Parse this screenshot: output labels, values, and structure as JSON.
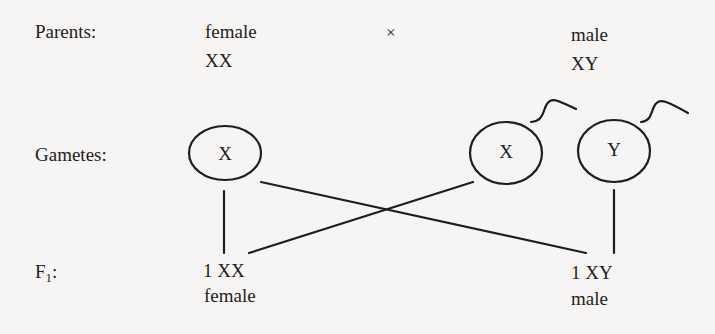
{
  "rows": {
    "parents_label": "Parents:",
    "gametes_label": "Gametes:",
    "f1_label_main": "F",
    "f1_label_sub": "1",
    "f1_label_colon": ":"
  },
  "parents": {
    "female": {
      "sex": "female",
      "genotype": "XX"
    },
    "cross_symbol": "×",
    "male": {
      "sex": "male",
      "genotype": "XY"
    }
  },
  "gametes": {
    "egg": {
      "chromosome": "X",
      "type": "egg"
    },
    "sperm1": {
      "chromosome": "X",
      "type": "sperm"
    },
    "sperm2": {
      "chromosome": "Y",
      "type": "sperm"
    }
  },
  "offspring": {
    "female": {
      "ratio_genotype": "1 XX",
      "sex": "female"
    },
    "male": {
      "ratio_genotype": "1 XY",
      "sex": "male"
    }
  },
  "colors": {
    "ink": "#1e1e1e",
    "paper": "#f6f5f3"
  }
}
